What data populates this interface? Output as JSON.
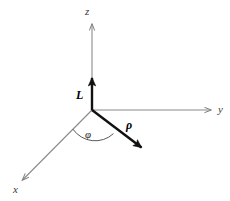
{
  "figure": {
    "background_color": "#ffffff",
    "width": 230,
    "height": 201
  },
  "colors": {
    "axis_line": "#8a8a8a",
    "vector_line": "#111111",
    "arc_line": "#555555",
    "label_text": "#1a1a1a",
    "background": "#ffffff"
  },
  "geometry": {
    "origin": {
      "x": 92,
      "y": 110
    },
    "z_axis_tip": {
      "x": 92,
      "y": 22
    },
    "y_axis_tip": {
      "x": 213,
      "y": 110
    },
    "x_axis_tip": {
      "x": 20,
      "y": 182
    },
    "L_vector_tip": {
      "x": 92,
      "y": 72
    },
    "rho_vector_tip": {
      "x": 147,
      "y": 153
    },
    "arc_radius": 27
  },
  "axes": [
    {
      "name": "z-axis",
      "label": "z",
      "direction": "up"
    },
    {
      "name": "y-axis",
      "label": "y",
      "direction": "right"
    },
    {
      "name": "x-axis",
      "label": "x",
      "direction": "down-left"
    }
  ],
  "vectors": [
    {
      "name": "angular-momentum-vector",
      "label": "L",
      "direction": "up along z"
    },
    {
      "name": "radial-vector",
      "label": "ρ",
      "direction": "down-right in xy-plane"
    }
  ],
  "angles": [
    {
      "name": "azimuthal-angle",
      "label": "φ",
      "between": "x-axis and rho vector"
    }
  ],
  "labels": {
    "z": "z",
    "y": "y",
    "x": "x",
    "L": "L",
    "rho": "ρ",
    "phi": "φ"
  }
}
